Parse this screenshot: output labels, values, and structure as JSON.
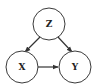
{
  "diagram": {
    "type": "causal-dag",
    "nodes": [
      {
        "id": "Z",
        "label": "Z",
        "cx": 49,
        "cy": 24,
        "r": 16
      },
      {
        "id": "X",
        "label": "X",
        "cx": 22,
        "cy": 67,
        "r": 16
      },
      {
        "id": "Y",
        "label": "Y",
        "cx": 75,
        "cy": 67,
        "r": 16
      }
    ],
    "edges": [
      {
        "from": "Z",
        "to": "X"
      },
      {
        "from": "Z",
        "to": "Y"
      },
      {
        "from": "X",
        "to": "Y"
      }
    ],
    "colors": {
      "stroke": "#3a3a3a",
      "fill": "#ffffff",
      "text": "#222222"
    }
  }
}
